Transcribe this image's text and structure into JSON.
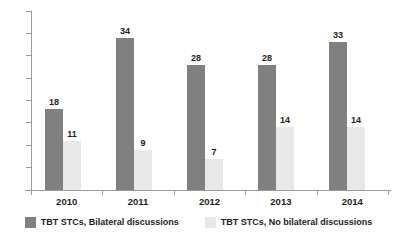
{
  "chart_data": {
    "type": "bar",
    "title": "",
    "subtitle": "",
    "xlabel": "",
    "ylabel": "",
    "categories": [
      "2010",
      "2011",
      "2012",
      "2013",
      "2014"
    ],
    "series": [
      {
        "name": "TBT STCs, Bilateral discussions",
        "color": "#808080",
        "values": [
          18,
          34,
          28,
          28,
          33
        ]
      },
      {
        "name": "TBT STCs, No bilateral discussions",
        "color": "#e8e8e8",
        "values": [
          11,
          9,
          7,
          14,
          14
        ]
      }
    ],
    "ylim": [
      0,
      40
    ],
    "ytick_step": 5,
    "yticks": [
      "0",
      "5",
      "10",
      "15",
      "20",
      "25",
      "30",
      "35",
      "40"
    ],
    "grid": false,
    "legend_position": "bottom",
    "data_labels": true
  },
  "axis": {
    "y_ticks": [
      {
        "value": 40,
        "label": "40"
      },
      {
        "value": 35,
        "label": "35"
      },
      {
        "value": 30,
        "label": "30"
      },
      {
        "value": 25,
        "label": "25"
      },
      {
        "value": 20,
        "label": "20"
      },
      {
        "value": 15,
        "label": "15"
      },
      {
        "value": 10,
        "label": "10"
      },
      {
        "value": 5,
        "label": "5"
      },
      {
        "value": 0,
        "label": "0"
      }
    ],
    "x_labels": [
      "2010",
      "2011",
      "2012",
      "2013",
      "2014"
    ]
  },
  "bars": {
    "g0": {
      "dark": "18",
      "light": "11"
    },
    "g1": {
      "dark": "34",
      "light": "9"
    },
    "g2": {
      "dark": "28",
      "light": "7"
    },
    "g3": {
      "dark": "28",
      "light": "14"
    },
    "g4": {
      "dark": "33",
      "light": "14"
    }
  },
  "legend": {
    "items": [
      {
        "label": "TBT STCs, Bilateral discussions",
        "color": "#808080"
      },
      {
        "label": "TBT STCs, No bilateral discussions",
        "color": "#e8e8e8"
      }
    ]
  }
}
